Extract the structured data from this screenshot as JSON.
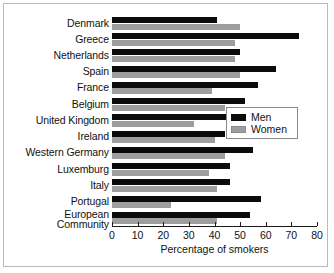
{
  "chart_data": {
    "type": "bar",
    "orientation": "horizontal",
    "title": "",
    "xlabel": "Percentage of smokers",
    "ylabel": "",
    "xlim": [
      0,
      80
    ],
    "xticks": [
      0,
      10,
      20,
      30,
      40,
      50,
      60,
      70,
      80
    ],
    "xticklabels": [
      "0",
      "10",
      "20",
      "30",
      "40",
      "50",
      "60",
      "70",
      "80"
    ],
    "grid": false,
    "legend_position": "center-right",
    "categories": [
      "Denmark",
      "Greece",
      "Netherlands",
      "Spain",
      "France",
      "Belgium",
      "United Kingdom",
      "Ireland",
      "Western Germany",
      "Luxemburg",
      "Italy",
      "Portugal",
      "European Community"
    ],
    "series": [
      {
        "name": "Men",
        "color": "#0b0b0b",
        "values": [
          41,
          73,
          50,
          64,
          57,
          52,
          46,
          44,
          55,
          46,
          46,
          58,
          54
        ]
      },
      {
        "name": "Women",
        "color": "#9e9e9e",
        "values": [
          50,
          48,
          48,
          50,
          39,
          44,
          32,
          40,
          44,
          38,
          41,
          23,
          41
        ]
      }
    ]
  },
  "legend": {
    "entries": [
      {
        "label": "Men"
      },
      {
        "label": "Women"
      }
    ]
  },
  "axis": {
    "x_title": "Percentage of smokers"
  }
}
